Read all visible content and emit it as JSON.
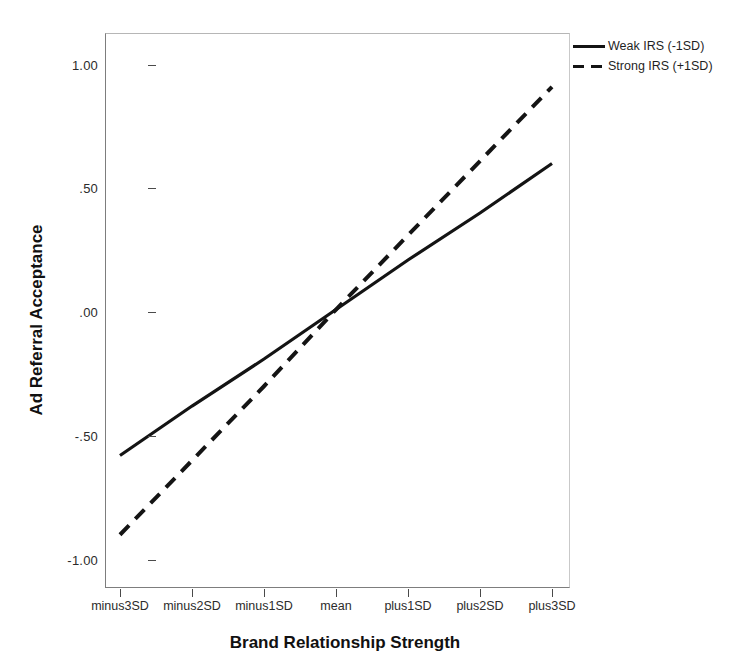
{
  "chart_data": {
    "type": "line",
    "title": "",
    "xlabel": "Brand Relationship Strength",
    "ylabel": "Ad Referral Acceptance",
    "categories": [
      "minus3SD",
      "minus2SD",
      "minus1SD",
      "mean",
      "plus1SD",
      "plus2SD",
      "plus3SD"
    ],
    "x": [
      -3,
      -2,
      -1,
      0,
      1,
      2,
      3
    ],
    "ylim": [
      -1.12,
      1.13
    ],
    "xlim": [
      -3.2,
      3.2
    ],
    "yticks": [
      1.0,
      0.5,
      0.0,
      -0.5,
      -1.0
    ],
    "ytick_labels": [
      "1.00",
      ".50",
      ".00",
      "-.50",
      "-1.00"
    ],
    "grid": false,
    "legend_position": "top-right-outside",
    "series": [
      {
        "name": "Weak IRS (-1SD)",
        "style": "solid",
        "color": "#141414",
        "values": [
          -0.58,
          -0.38,
          -0.19,
          0.01,
          0.21,
          0.4,
          0.6
        ]
      },
      {
        "name": "Strong IRS (+1SD)",
        "style": "dashed",
        "color": "#141414",
        "values": [
          -0.9,
          -0.6,
          -0.3,
          0.01,
          0.31,
          0.61,
          0.91
        ]
      }
    ]
  },
  "legend": {
    "items": [
      {
        "label": "Weak IRS (-1SD)",
        "style": "solid"
      },
      {
        "label": "Strong IRS (+1SD)",
        "style": "dashed"
      }
    ]
  },
  "axes": {
    "y_title": "Ad Referral Acceptance",
    "x_title": "Brand Relationship Strength",
    "y_tick_labels": [
      "1.00",
      ".50",
      ".00",
      "-.50",
      "-1.00"
    ],
    "x_tick_labels": [
      "minus3SD",
      "minus2SD",
      "minus1SD",
      "mean",
      "plus1SD",
      "plus2SD",
      "plus3SD"
    ]
  }
}
